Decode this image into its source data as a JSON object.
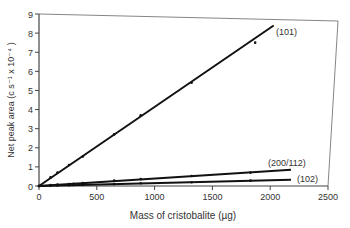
{
  "chart_data": {
    "type": "line",
    "title": "",
    "xlabel": "Mass of cristobalite (µg)",
    "ylabel": "Net peak area (c s⁻¹ x 10⁻⁴ )",
    "xlim": [
      0,
      2500
    ],
    "ylim": [
      0,
      9
    ],
    "x_ticks": [
      0,
      500,
      1000,
      1500,
      2000,
      2500
    ],
    "x_tick_labels": [
      "0",
      "500",
      "1000",
      "1500",
      "2000",
      "2500"
    ],
    "y_ticks": [
      0,
      1,
      2,
      3,
      4,
      5,
      6,
      7,
      8,
      9
    ],
    "y_tick_labels": [
      "0",
      "1",
      "2",
      "3",
      "4",
      "5",
      "6",
      "7",
      "8",
      "9"
    ],
    "grid": false,
    "legend": "inline labels at line ends",
    "series": [
      {
        "name": "(101)",
        "fit_line": [
          [
            0,
            0
          ],
          [
            2030,
            8.4
          ]
        ],
        "points": [
          [
            0,
            0
          ],
          [
            100,
            0.45
          ],
          [
            160,
            0.7
          ],
          [
            260,
            1.1
          ],
          [
            380,
            1.55
          ],
          [
            650,
            2.7
          ],
          [
            880,
            3.7
          ],
          [
            1320,
            5.4
          ],
          [
            1870,
            7.5
          ]
        ]
      },
      {
        "name": "(200/112)",
        "fit_line": [
          [
            0,
            0
          ],
          [
            2180,
            0.85
          ]
        ],
        "points": [
          [
            0,
            0
          ],
          [
            100,
            0.05
          ],
          [
            160,
            0.08
          ],
          [
            260,
            0.1
          ],
          [
            300,
            0.12
          ],
          [
            380,
            0.15
          ],
          [
            650,
            0.28
          ],
          [
            880,
            0.36
          ],
          [
            1320,
            0.52
          ],
          [
            1830,
            0.7
          ]
        ]
      },
      {
        "name": "(102)",
        "fit_line": [
          [
            0,
            0
          ],
          [
            2180,
            0.33
          ]
        ],
        "points": [
          [
            0,
            0
          ],
          [
            100,
            0.02
          ],
          [
            160,
            0.03
          ],
          [
            260,
            0.04
          ],
          [
            300,
            0.05
          ],
          [
            380,
            0.06
          ],
          [
            650,
            0.1
          ],
          [
            880,
            0.14
          ],
          [
            1320,
            0.2
          ],
          [
            1830,
            0.28
          ]
        ]
      }
    ]
  },
  "labels": {
    "xlabel": "Mass of cristobalite (µg)",
    "ylabel": "Net peak area (c s⁻¹ x 10⁻⁴ )",
    "series_101": "(101)",
    "series_200_112": "(200/112)",
    "series_102": "(102)"
  }
}
